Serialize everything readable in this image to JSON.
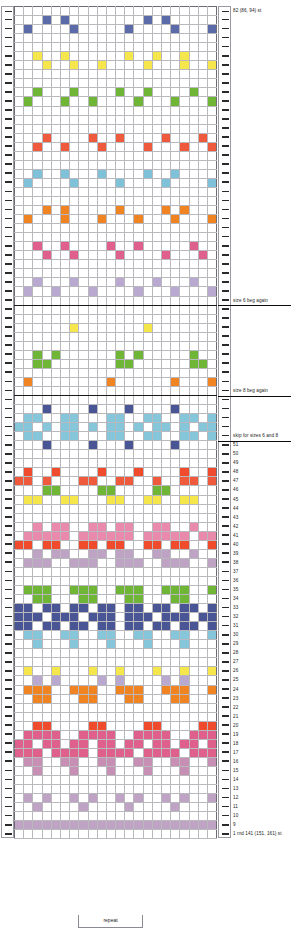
{
  "chart_data": {
    "type": "heatmap",
    "title": "",
    "xlabel": "",
    "ylabel": "",
    "grid": true,
    "legend_position": "none",
    "columns": 22,
    "rows": 98,
    "palette": {
      "background": "#ffffff",
      "navy": "#5b6aa8",
      "yellow": "#f5e64b",
      "green": "#6fb536",
      "coral": "#f05a3c",
      "lightblue": "#7fc1d9",
      "orange": "#f08423",
      "rose": "#e0608c",
      "lavender": "#b9a8cf",
      "darkblue": "#4a5596",
      "pink": "#e98aac",
      "red": "#ef4b2c",
      "mauve": "#c78fb4",
      "teal": "#86c6da",
      "plum": "#bfa3c4"
    },
    "grid_rows_top_to_bottom": [
      "......................",
      "...N.N........N.N.....",
      ".N....N.....N....N...N",
      "......................",
      "......................",
      "..Y..Y......Y..Y..Y...",
      "...Y..Y..Y....Y...Y..Y",
      "......................",
      "......................",
      "..G...G....G..G....G..",
      ".G...G..G....G...G...G",
      "......................",
      "......................",
      "......................",
      "...C....C..C....C...C.",
      "..C..C...C....C...C..C",
      "......................",
      "......................",
      "..B..B...B....B..B....",
      ".B....B....B....B....B",
      "......................",
      "......................",
      "...O.O.....O....O.O...",
      ".O...O...O...O...O...O",
      "......................",
      "......................",
      "..R..R....R..R.....R..",
      "...R..R....R....R...R.",
      "......................",
      "......................",
      "..L...L....L...L...L..",
      ".L..L...L....L...L...L",
      "......................",
      "......................",
      "......................",
      "......Y.......Y.......",
      "......................",
      "......................",
      "..G.G......G.G.....G..",
      "..GG.......GG......GG.",
      "......................",
      ".O........O......O...O",
      "......................",
      "......................",
      "...D....D...D....D....",
      ".TT..TT...TT..TT..TT.T",
      "TT.T.TT.T.TT.T.TT.T.TT",
      ".TT..TT...TT..TT..TT.T",
      "...D....D...D....D....",
      "......................",
      "......................",
      ".C..C....C...C....C..C",
      "CC.C...CC..CC..C..CC.C",
      "...GG....GG....GG.....",
      ".YY..YY...YY..YY..YY..",
      "......................",
      "......................",
      "..P.PP..PP.PP..PP..P..",
      ".PPPPP.PPPPPP.PPPPP.PP",
      "RR.RR..RR.RR..RR.RR..R",
      "..V.VV..VV.VV..VV..V..",
      ".VVV..VVV..VVV..VVV..V",
      "......................",
      "......................",
      ".GGG..GGG..GGG..GGG..G",
      "..GG...GG...GG...GG...",
      "DD.DD.DD.DD.DD.DD.DD.D",
      "DDD.DDD.DDD.DDD.DDD.DD",
      "DD.DD.DD.DD.DD.DD.DD.D",
      ".TT..TT..TT..TT..TT..T",
      "..T...T...T...T...T...",
      "......................",
      "......................",
      ".Y..Y...Y..Y...Y..Y..Y",
      "..L.L....L.L....L.L...",
      ".OOO..OOO..OOO..OOO..O",
      "..OO...OO...OO...OO...",
      "......................",
      "......................",
      "..RR....RR....RR....RR",
      ".RRRR..RRRR..RRRR..RRR",
      "RR.RR.RR.RR.RR.RR.RR.R",
      "RRR.RRRR.RRRR.RRRR.RRR",
      ".MM..MM..MM..MM..MM..M",
      "..M...M...M...M...M...",
      "......................",
      "......................",
      ".V.V..V.V..V.V..V.V..V",
      "..V....V....V....V....",
      "......................",
      "VVVVVVVVVVVVVVVVVVVVVV",
      "......................"
    ]
  },
  "labels": {
    "top_stitch_count": "82 (86, 94) st",
    "size6_beg_again": "size 6 beg again",
    "size8_beg_again": "size 8 beg again",
    "skip_for_sizes": "skip for sizes 6 and 8",
    "bottom_row": "1 rnd 141 (151, 161) st",
    "repeat": "repeat",
    "row_numbers": [
      "51",
      "50",
      "49",
      "48",
      "47",
      "46",
      "45",
      "44",
      "43",
      "42",
      "41",
      "40",
      "39",
      "38",
      "37",
      "36",
      "35",
      "34",
      "33",
      "32",
      "31",
      "30",
      "29",
      "28",
      "27",
      "26",
      "25",
      "24",
      "23",
      "22",
      "21",
      "20",
      "19",
      "18",
      "17",
      "16",
      "15",
      "14",
      "13",
      "12",
      "11",
      "10",
      "9",
      "8",
      "7",
      "6",
      "5",
      "4",
      "3",
      "2"
    ]
  }
}
